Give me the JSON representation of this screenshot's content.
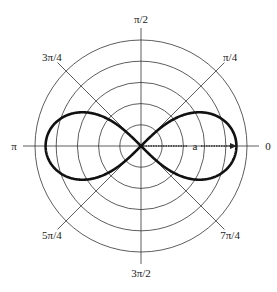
{
  "diagram": {
    "curve": "lemniscate r^2 = a^2 cos(2θ)",
    "grid_circle_count": 5,
    "curve_extent_fraction_of_outer_circle": 0.9,
    "angle_labels": [
      {
        "id": "angle-0",
        "text": "0",
        "angle_deg": 0
      },
      {
        "id": "angle-pi-4",
        "text": "π/4",
        "angle_deg": 45
      },
      {
        "id": "angle-pi-2",
        "text": "π/2",
        "angle_deg": 90
      },
      {
        "id": "angle-3pi-4",
        "text": "3π/4",
        "angle_deg": 135
      },
      {
        "id": "angle-pi",
        "text": "π",
        "angle_deg": 180
      },
      {
        "id": "angle-5pi-4",
        "text": "5π/4",
        "angle_deg": 225
      },
      {
        "id": "angle-3pi-2",
        "text": "3π/2",
        "angle_deg": 270
      },
      {
        "id": "angle-7pi-4",
        "text": "7π/4",
        "angle_deg": 315
      }
    ],
    "radius_label": "a",
    "colors": {
      "grid": "#333333",
      "curve": "#111111",
      "text": "#222222"
    }
  }
}
